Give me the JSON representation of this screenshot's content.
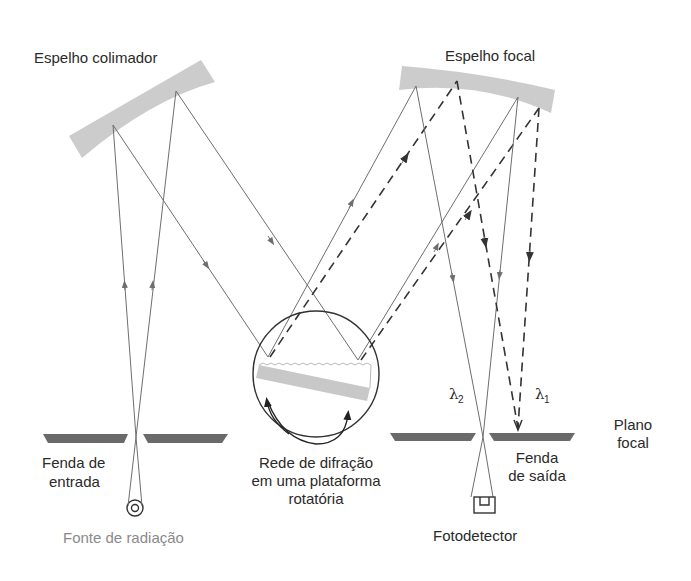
{
  "diagram": {
    "labels": {
      "collimating_mirror": "Espelho colimador",
      "focal_mirror": "Espelho focal",
      "entrance_slit_line1": "Fenda de",
      "entrance_slit_line2": "entrada",
      "source": "Fonte de radiação",
      "grating_line1": "Rede de difração",
      "grating_line2": "em uma plataforma",
      "grating_line3": "rotatória",
      "exit_slit_line1": "Fenda",
      "exit_slit_line2": "de saída",
      "detector": "Fotodetector",
      "focal_plane_line1": "Plano",
      "focal_plane_line2": "focal",
      "lambda2": "λ",
      "lambda2_sub": "2",
      "lambda1": "λ",
      "lambda1_sub": "1"
    },
    "components": [
      {
        "id": "source",
        "label": "Fonte de radiação"
      },
      {
        "id": "entrance_slit",
        "label": "Fenda de entrada"
      },
      {
        "id": "collimating_mirror",
        "label": "Espelho colimador"
      },
      {
        "id": "diffraction_grating",
        "label": "Rede de difração em uma plataforma rotatória"
      },
      {
        "id": "focal_mirror",
        "label": "Espelho focal"
      },
      {
        "id": "exit_slit",
        "label": "Fenda de saída"
      },
      {
        "id": "photodetector",
        "label": "Fotodetector"
      }
    ],
    "legend": {
      "solid_ray": "λ2",
      "dashed_ray": "λ1"
    },
    "colors": {
      "mirror": "#cccccc",
      "slit": "#6a6a6a",
      "ray_solid": "#6e6e6e",
      "ray_dashed": "#333333",
      "source_label": "#8a8a8a"
    }
  }
}
